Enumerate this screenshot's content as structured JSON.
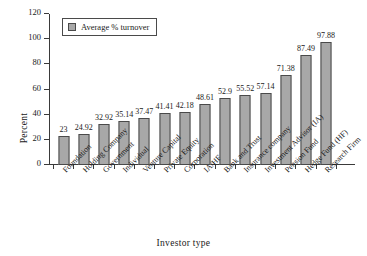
{
  "chart_data": {
    "type": "bar",
    "title": "",
    "xlabel": "Investor type",
    "ylabel": "Percent",
    "ylim": [
      0,
      120
    ],
    "yticks": [
      0,
      20,
      40,
      60,
      80,
      100,
      120
    ],
    "grid": false,
    "legend_position": "top-left",
    "legend": [
      "Average % turnover"
    ],
    "series_name": "Average % turnover",
    "bar_color": "#a8a8a8",
    "bar_edge_color": "#4a4a4a",
    "categories": [
      "Foundation",
      "Holding Company",
      "Government",
      "Individual",
      "Venture Capital",
      "Private Equity",
      "Corporation",
      "IA/HF",
      "Bank and Trust",
      "Insurance company",
      "Investment Advisor (IA)",
      "Pension Fund",
      "Hedge Fund (HF)",
      "Research Firm"
    ],
    "values": [
      23,
      24.92,
      32.92,
      35.14,
      37.47,
      41.41,
      42.18,
      48.61,
      52.9,
      55.52,
      57.14,
      71.38,
      87.49,
      97.88
    ],
    "value_labels": [
      "23",
      "24.92",
      "32.92",
      "35.14",
      "37.47",
      "41.41",
      "42.18",
      "48.61",
      "52.9",
      "55.52",
      "57.14",
      "71.38",
      "87.49",
      "97.88"
    ]
  }
}
